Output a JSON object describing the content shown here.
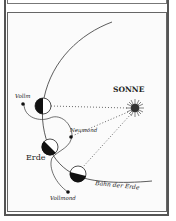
{
  "diagram": {
    "title_sun": "SONNE",
    "label_earth": "Erde",
    "label_new_moon": "Neumond",
    "label_full_moon_top": "Vollm",
    "label_full_moon_bottom": "Vollmond",
    "label_orbit": "Bahn der Erde"
  },
  "colors": {
    "ink": "#222222",
    "background": "#ffffff",
    "frame": "#555555"
  }
}
